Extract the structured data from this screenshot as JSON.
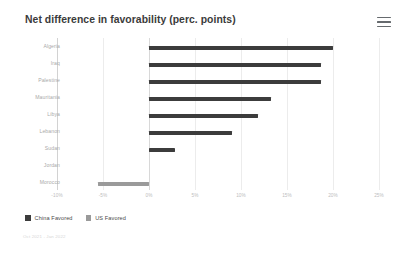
{
  "header": {
    "title": "Net difference in favorability (perc. points)",
    "menu_icon": "hamburger-menu-icon"
  },
  "footer": {
    "note": "Oct 2021 - Jan 2022",
    "credit": ""
  },
  "chart_data": {
    "type": "bar",
    "orientation": "horizontal",
    "title": "Net difference in favorability (perc. points)",
    "xlabel": "",
    "ylabel": "",
    "xlim": [
      -10,
      25
    ],
    "grid": true,
    "tick_labels": [
      "-10%",
      "-5%",
      "0%",
      "5%",
      "10%",
      "15%",
      "20%",
      "25%"
    ],
    "tick_values": [
      -10,
      -5,
      0,
      5,
      10,
      15,
      20,
      25
    ],
    "legend_position": "bottom-left",
    "legend": [
      {
        "name": "China Favored",
        "color": "#3c3c3c"
      },
      {
        "name": "US Favored",
        "color": "#9a9a9a"
      }
    ],
    "categories": [
      "Algeria",
      "Iraq",
      "Palestine",
      "Mauritania",
      "Libya",
      "Lebanon",
      "Sudan",
      "Jordan",
      "Morocco"
    ],
    "values": [
      20.0,
      18.7,
      18.7,
      13.3,
      11.8,
      9.0,
      2.8,
      0.0,
      -5.5
    ],
    "bars": [
      {
        "label": "Algeria",
        "value": 20.0,
        "series": "China Favored",
        "color": "#3c3c3c"
      },
      {
        "label": "Iraq",
        "value": 18.7,
        "series": "China Favored",
        "color": "#3c3c3c"
      },
      {
        "label": "Palestine",
        "value": 18.7,
        "series": "China Favored",
        "color": "#3c3c3c"
      },
      {
        "label": "Mauritania",
        "value": 13.3,
        "series": "China Favored",
        "color": "#3c3c3c"
      },
      {
        "label": "Libya",
        "value": 11.8,
        "series": "China Favored",
        "color": "#3c3c3c"
      },
      {
        "label": "Lebanon",
        "value": 9.0,
        "series": "China Favored",
        "color": "#3c3c3c"
      },
      {
        "label": "Sudan",
        "value": 2.8,
        "series": "China Favored",
        "color": "#3c3c3c"
      },
      {
        "label": "Jordan",
        "value": 0.0,
        "series": "China Favored",
        "color": "#3c3c3c"
      },
      {
        "label": "Morocco",
        "value": -5.5,
        "series": "US Favored",
        "color": "#9a9a9a"
      }
    ]
  }
}
